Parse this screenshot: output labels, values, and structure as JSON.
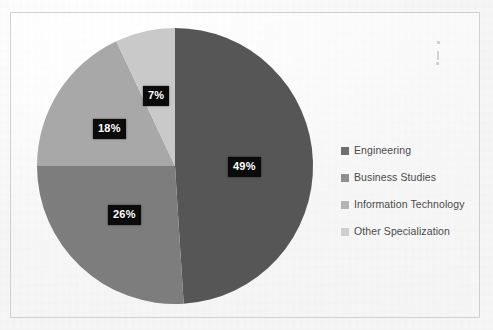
{
  "chart_data": {
    "type": "pie",
    "title": "",
    "labels": [
      "Engineering",
      "Business Studies",
      "Information Technology",
      "Other Specialization"
    ],
    "values": [
      49,
      26,
      18,
      7
    ],
    "value_labels": [
      "49%",
      "26%",
      "18%",
      "7%"
    ],
    "colors": [
      "#565656",
      "#7d7d7d",
      "#a8a8a8",
      "#c9c9c9"
    ],
    "units": "percent",
    "total": 100,
    "start_angle_deg": 0,
    "direction": "clockwise",
    "legend_position": "right",
    "grid": false,
    "xlabel": "",
    "ylabel": ""
  },
  "pie": {
    "center_x": 175,
    "center_y": 166,
    "radius": 138,
    "slices": [
      {
        "name": "engineering",
        "label": "49%",
        "value": 49,
        "color": "#565656",
        "label_x": 228,
        "label_y": 157
      },
      {
        "name": "business-studies",
        "label": "26%",
        "value": 26,
        "color": "#7d7d7d",
        "label_x": 108,
        "label_y": 205
      },
      {
        "name": "information-technology",
        "label": "18%",
        "value": 18,
        "color": "#a8a8a8",
        "label_x": 93,
        "label_y": 119
      },
      {
        "name": "other-specialization",
        "label": "7%",
        "value": 7,
        "color": "#c9c9c9",
        "label_x": 143,
        "label_y": 86
      }
    ]
  },
  "legend": {
    "items": [
      {
        "label": "Engineering",
        "color": "#6e6e6e"
      },
      {
        "label": "Business Studies",
        "color": "#8f8f8f"
      },
      {
        "label": "Information Technology",
        "color": "#b4b4b4"
      },
      {
        "label": "Other Specialization",
        "color": "#cfcfcf"
      }
    ]
  }
}
